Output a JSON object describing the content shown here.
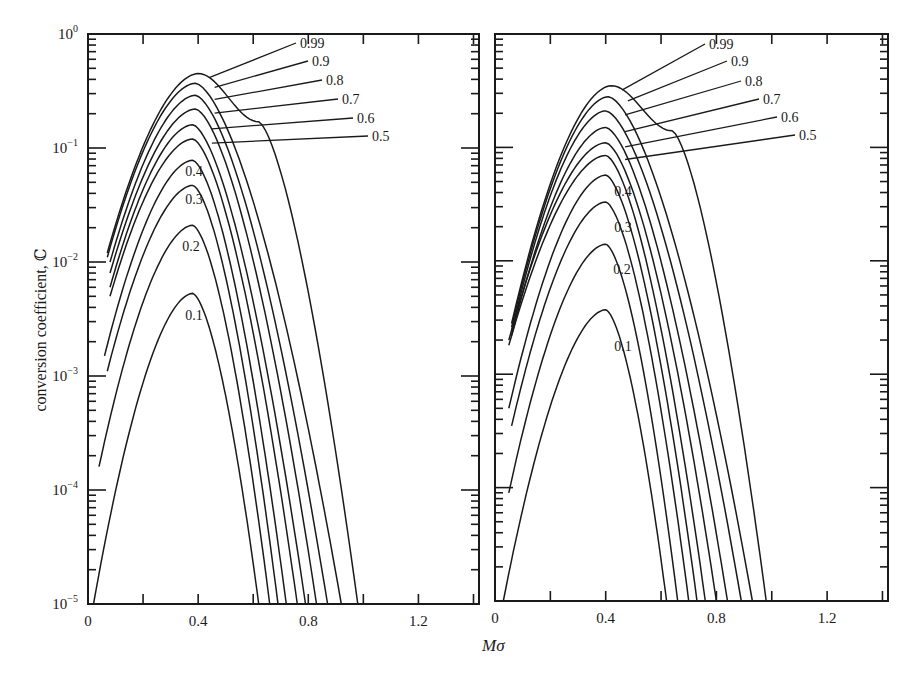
{
  "figure": {
    "ylabel": "conversion coefficient, ℂ",
    "xlabel": "Mσ",
    "x_ticks": [
      "0",
      "0.4",
      "0.8",
      "1.2"
    ],
    "y_ticks": [
      "10⁰",
      "10⁻¹",
      "10⁻²",
      "10⁻³",
      "10⁻⁴",
      "10⁻⁵"
    ],
    "line_color": "#1a1a1a",
    "background": "#ffffff"
  },
  "chart_data": [
    {
      "type": "line",
      "panel": "left",
      "title": "",
      "xlabel": "Mσ",
      "ylabel": "conversion coefficient, ℂ",
      "xscale": "linear",
      "yscale": "log",
      "xlim": [
        0,
        1.42
      ],
      "ylim": [
        1e-05,
        1
      ],
      "x_tick_labels": [
        "0",
        "0.4",
        "0.8",
        "1.2"
      ],
      "y_tick_labels": [
        "10^0",
        "10^-1",
        "10^-2",
        "10^-3",
        "10^-4",
        "10^-5"
      ],
      "grid": false,
      "series": [
        {
          "name": "0.99",
          "start": [
            0.07,
            0.012
          ],
          "peak": [
            0.4,
            0.45
          ],
          "end": [
            0.98,
            1e-05
          ],
          "shoulder": [
            0.62,
            0.17
          ]
        },
        {
          "name": "0.9",
          "start": [
            0.07,
            0.011
          ],
          "peak": [
            0.39,
            0.37
          ],
          "end": [
            0.92,
            1e-05
          ]
        },
        {
          "name": "0.8",
          "start": [
            0.08,
            0.01
          ],
          "peak": [
            0.39,
            0.29
          ],
          "end": [
            0.87,
            1e-05
          ]
        },
        {
          "name": "0.7",
          "start": [
            0.08,
            0.008
          ],
          "peak": [
            0.39,
            0.22
          ],
          "end": [
            0.83,
            1e-05
          ]
        },
        {
          "name": "0.6",
          "start": [
            0.08,
            0.006
          ],
          "peak": [
            0.38,
            0.16
          ],
          "end": [
            0.79,
            1e-05
          ]
        },
        {
          "name": "0.5",
          "start": [
            0.08,
            0.005
          ],
          "peak": [
            0.38,
            0.12
          ],
          "end": [
            0.76,
            1e-05
          ]
        },
        {
          "name": "0.4",
          "start": [
            0.06,
            0.0015
          ],
          "peak": [
            0.38,
            0.078
          ],
          "end": [
            0.72,
            1e-05
          ]
        },
        {
          "name": "0.3",
          "start": [
            0.07,
            0.0011
          ],
          "peak": [
            0.38,
            0.047
          ],
          "end": [
            0.69,
            1e-05
          ]
        },
        {
          "name": "0.2",
          "start": [
            0.04,
            0.00016
          ],
          "peak": [
            0.38,
            0.021
          ],
          "end": [
            0.66,
            1e-05
          ]
        },
        {
          "name": "0.1",
          "start": [
            0.02,
            1e-05
          ],
          "peak": [
            0.38,
            0.0053
          ],
          "end": [
            0.62,
            1e-05
          ]
        }
      ]
    },
    {
      "type": "line",
      "panel": "right",
      "title": "",
      "xlabel": "Mσ",
      "ylabel": "",
      "xscale": "linear",
      "yscale": "log",
      "xlim": [
        0,
        1.42
      ],
      "ylim": [
        1e-05,
        1
      ],
      "x_tick_labels": [
        "0",
        "0.4",
        "0.8",
        "1.2"
      ],
      "grid": false,
      "series": [
        {
          "name": "0.99",
          "start": [
            0.06,
            0.0028
          ],
          "peak": [
            0.42,
            0.35
          ],
          "end": [
            0.98,
            1e-05
          ],
          "shoulder": [
            0.64,
            0.14
          ]
        },
        {
          "name": "0.9",
          "start": [
            0.06,
            0.0026
          ],
          "peak": [
            0.41,
            0.28
          ],
          "end": [
            0.93,
            1e-05
          ]
        },
        {
          "name": "0.8",
          "start": [
            0.06,
            0.0024
          ],
          "peak": [
            0.4,
            0.21
          ],
          "end": [
            0.89,
            1e-05
          ]
        },
        {
          "name": "0.7",
          "start": [
            0.06,
            0.0022
          ],
          "peak": [
            0.4,
            0.15
          ],
          "end": [
            0.84,
            1e-05
          ]
        },
        {
          "name": "0.6",
          "start": [
            0.05,
            0.002
          ],
          "peak": [
            0.4,
            0.11
          ],
          "end": [
            0.8,
            1e-05
          ]
        },
        {
          "name": "0.5",
          "start": [
            0.05,
            0.0018
          ],
          "peak": [
            0.4,
            0.085
          ],
          "end": [
            0.76,
            1e-05
          ]
        },
        {
          "name": "0.4",
          "start": [
            0.05,
            0.0005
          ],
          "peak": [
            0.4,
            0.057
          ],
          "end": [
            0.73,
            1e-05
          ]
        },
        {
          "name": "0.3",
          "start": [
            0.06,
            0.00035
          ],
          "peak": [
            0.4,
            0.033
          ],
          "end": [
            0.7,
            1e-05
          ]
        },
        {
          "name": "0.2",
          "start": [
            0.05,
            9e-05
          ],
          "peak": [
            0.4,
            0.014
          ],
          "end": [
            0.66,
            1e-05
          ]
        },
        {
          "name": "0.1",
          "start": [
            0.03,
            1e-05
          ],
          "peak": [
            0.4,
            0.0037
          ],
          "end": [
            0.62,
            1e-05
          ]
        }
      ]
    }
  ]
}
